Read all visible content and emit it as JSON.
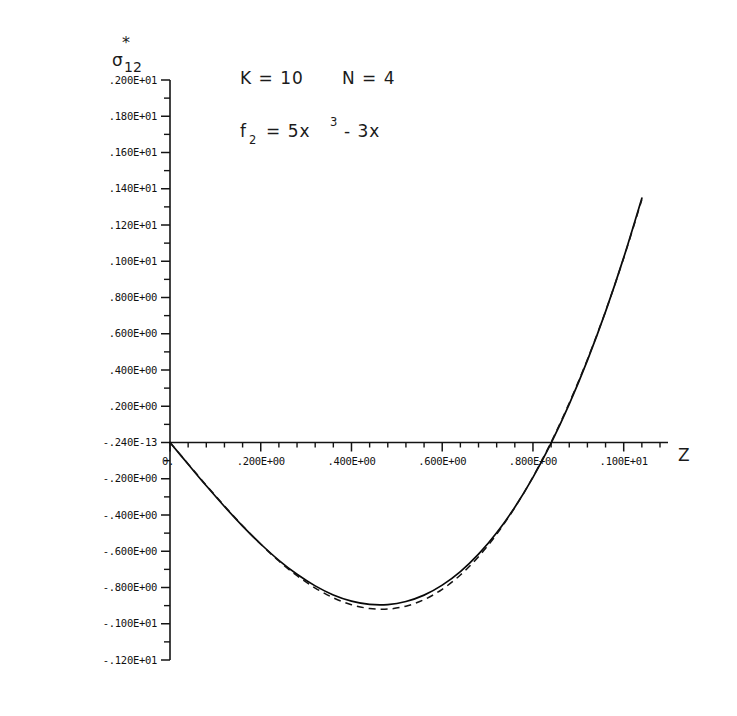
{
  "figure": {
    "background_color": "#ffffff",
    "ink_color": "#111111"
  },
  "axis_titles": {
    "y_symbol": "σ",
    "y_subscript": "12",
    "y_superscript": "*",
    "x_label": "Z"
  },
  "annotations": {
    "line1_k": "K = 10",
    "line1_n": "N = 4",
    "line2_f": "f",
    "line2_f_sub": "2",
    "line2_eq": "=  5x",
    "line2_exp": "3",
    "line2_tail": "-  3x"
  },
  "chart_data": {
    "type": "line",
    "title": "",
    "subtitle": "",
    "xlabel": "Z",
    "ylabel": "σ*12",
    "xlim": [
      0.0,
      1.08
    ],
    "ylim": [
      -1.2,
      2.0
    ],
    "grid": false,
    "legend": "none",
    "x_tick_labels": [
      ".200E+00",
      ".400E+00",
      ".600E+00",
      ".800E+00",
      ".100E+01"
    ],
    "x_tick_values": [
      0.2,
      0.4,
      0.6,
      0.8,
      1.0
    ],
    "x_origin_label": "0.",
    "x_minor_per_interval": 4,
    "y_tick_labels": [
      ".200E+01",
      ".180E+01",
      ".160E+01",
      ".140E+01",
      ".120E+01",
      ".100E+01",
      ".800E+00",
      ".600E+00",
      ".400E+00",
      ".200E+00",
      "-.240E-13",
      "-.200E+00",
      "-.400E+00",
      "-.600E+00",
      "-.800E+00",
      "-.100E+01",
      "-.120E+01"
    ],
    "y_tick_values": [
      2.0,
      1.8,
      1.6,
      1.4,
      1.2,
      1.0,
      0.8,
      0.6,
      0.4,
      0.2,
      0.0,
      -0.2,
      -0.4,
      -0.6,
      -0.8,
      -1.0,
      -1.2
    ],
    "y_minor_per_interval": 1,
    "series": [
      {
        "name": "solid-curve",
        "style": "solid",
        "color": "#080808",
        "x": [
          0.0,
          0.04,
          0.08,
          0.12,
          0.16,
          0.2,
          0.24,
          0.28,
          0.32,
          0.36,
          0.4,
          0.44,
          0.48,
          0.52,
          0.56,
          0.6,
          0.64,
          0.68,
          0.72,
          0.76,
          0.8,
          0.84,
          0.88,
          0.92,
          0.96,
          1.0,
          1.04
        ],
        "y": [
          0.0,
          -0.12,
          -0.239,
          -0.353,
          -0.461,
          -0.56,
          -0.65,
          -0.727,
          -0.791,
          -0.841,
          -0.875,
          -0.893,
          -0.894,
          -0.877,
          -0.842,
          -0.787,
          -0.712,
          -0.616,
          -0.498,
          -0.357,
          -0.192,
          -0.003,
          0.212,
          0.453,
          0.722,
          1.02,
          1.348
        ]
      },
      {
        "name": "dashed-curve",
        "style": "dashed",
        "color": "#141414",
        "x": [
          0.0,
          0.04,
          0.08,
          0.12,
          0.16,
          0.2,
          0.24,
          0.28,
          0.32,
          0.36,
          0.4,
          0.44,
          0.48,
          0.52,
          0.56,
          0.6,
          0.64,
          0.68,
          0.72,
          0.76,
          0.8,
          0.84,
          0.88,
          0.92,
          0.96,
          1.0,
          1.04
        ],
        "y": [
          0.0,
          -0.118,
          -0.236,
          -0.35,
          -0.459,
          -0.561,
          -0.654,
          -0.735,
          -0.803,
          -0.857,
          -0.895,
          -0.916,
          -0.919,
          -0.903,
          -0.867,
          -0.81,
          -0.731,
          -0.63,
          -0.506,
          -0.359,
          -0.19,
          0.002,
          0.218,
          0.458,
          0.724,
          1.018,
          1.34
        ]
      }
    ]
  }
}
